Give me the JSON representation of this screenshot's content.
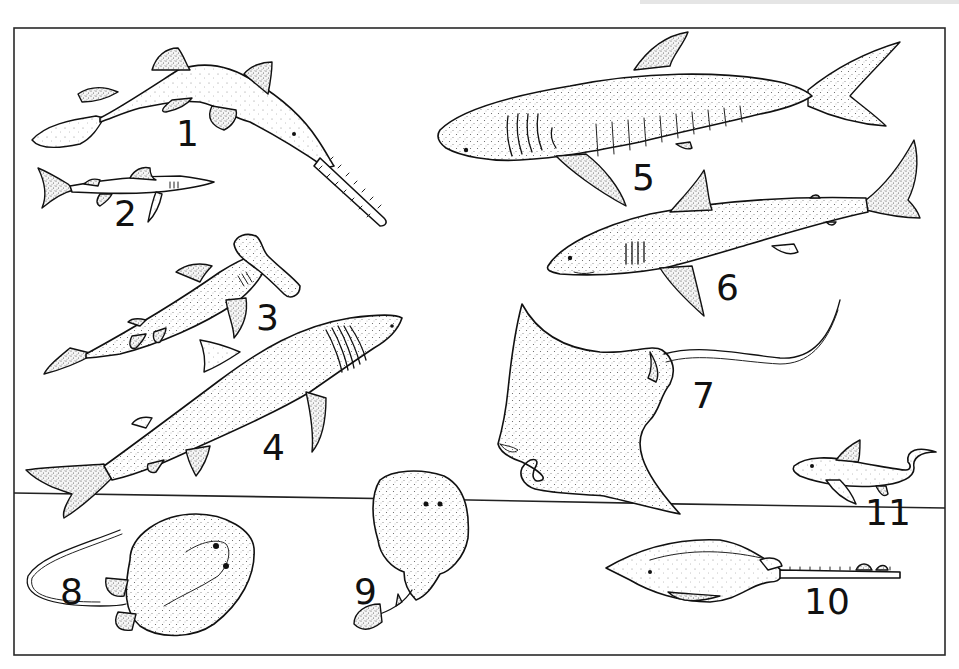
{
  "plate": {
    "description": "Illustration plate of cartilaginous fishes (sharks, rays, chimaera) numbered 1-11",
    "frame": {
      "x": 14,
      "y": 28,
      "width": 931,
      "height": 627
    },
    "colors": {
      "ink": "#111111",
      "paper": "#ffffff",
      "stipple": "#5a5a5a"
    }
  },
  "labels": [
    {
      "id": 1,
      "text": "1",
      "x": 176,
      "y": 146
    },
    {
      "id": 2,
      "text": "2",
      "x": 114,
      "y": 226
    },
    {
      "id": 3,
      "text": "3",
      "x": 256,
      "y": 330
    },
    {
      "id": 4,
      "text": "4",
      "x": 262,
      "y": 460
    },
    {
      "id": 5,
      "text": "5",
      "x": 632,
      "y": 190
    },
    {
      "id": 6,
      "text": "6",
      "x": 716,
      "y": 300
    },
    {
      "id": 7,
      "text": "7",
      "x": 692,
      "y": 408
    },
    {
      "id": 8,
      "text": "8",
      "x": 60,
      "y": 604
    },
    {
      "id": 9,
      "text": "9",
      "x": 354,
      "y": 604
    },
    {
      "id": 10,
      "text": "10",
      "x": 804,
      "y": 614
    },
    {
      "id": 11,
      "text": "11",
      "x": 865,
      "y": 525
    }
  ],
  "figures": [
    {
      "id": 1,
      "name": "sawfish-shark"
    },
    {
      "id": 2,
      "name": "small-dogfish-shark"
    },
    {
      "id": 3,
      "name": "hammerhead-shark"
    },
    {
      "id": 4,
      "name": "basking-shark"
    },
    {
      "id": 5,
      "name": "whale-shark"
    },
    {
      "id": 6,
      "name": "mackerel-shark"
    },
    {
      "id": 7,
      "name": "manta-ray"
    },
    {
      "id": 8,
      "name": "stingray"
    },
    {
      "id": 9,
      "name": "electric-ray"
    },
    {
      "id": 10,
      "name": "sawfish"
    },
    {
      "id": 11,
      "name": "chimaera"
    }
  ]
}
